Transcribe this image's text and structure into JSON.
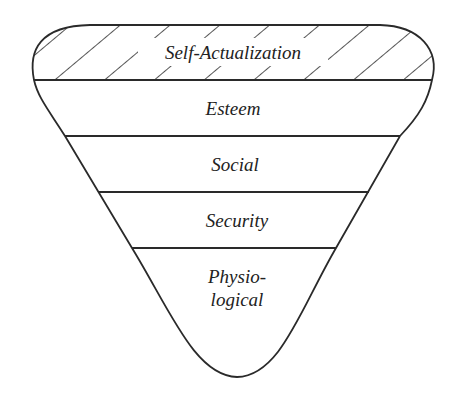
{
  "diagram": {
    "type": "inverted-pyramid",
    "stroke_color": "#2a2a2a",
    "background": "#ffffff",
    "levels": [
      {
        "label": "Self-Actualization",
        "hatched": true
      },
      {
        "label": "Esteem",
        "hatched": false
      },
      {
        "label": "Social",
        "hatched": false
      },
      {
        "label": "Security",
        "hatched": false
      },
      {
        "label_line1": "Physio-",
        "label_line2": "logical",
        "hatched": false
      }
    ]
  }
}
